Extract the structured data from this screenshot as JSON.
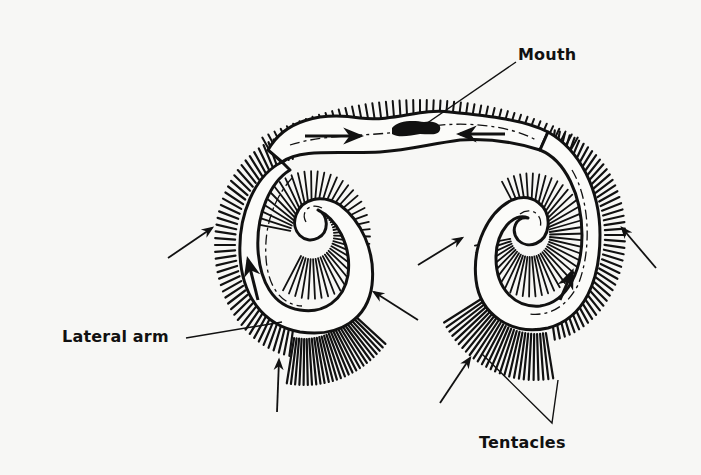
{
  "figure": {
    "labels": {
      "mouth": "Mouth",
      "lateral_arm": "Lateral arm",
      "tentacles": "Tentacles"
    },
    "colors": {
      "ink": "#111111",
      "background": "#f7f7f5",
      "body_fill": "#fbfbf9"
    },
    "annotations": [
      {
        "label": "Mouth",
        "points_to": "dark slit at center of the connecting band"
      },
      {
        "label": "Lateral arm",
        "points_to": "lower edge of left spiral arm"
      },
      {
        "label": "Tentacles",
        "points_to": "two leader lines into the fringe of the right arm"
      }
    ],
    "flow_arrows": [
      "inward along top band from left",
      "inward along top band from right",
      "upward inside left arm",
      "upward inside right arm",
      "external water-current arrows pointing into the tentacle fringe (6)"
    ]
  }
}
